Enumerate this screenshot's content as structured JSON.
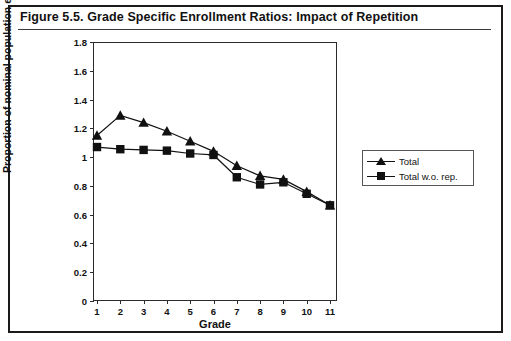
{
  "figure": {
    "title": "Figure 5.5.  Grade Specific Enrollment Ratios: Impact of Repetition"
  },
  "chart_data": {
    "type": "line",
    "title": "Grade Specific Enrollment Ratios: Impact of Repetition",
    "xlabel": "Grade",
    "ylabel": "Proportion of nominal population enrolled",
    "categories": [
      1,
      2,
      3,
      4,
      5,
      6,
      7,
      8,
      9,
      10,
      11
    ],
    "x_tick_labels": [
      "1",
      "2",
      "3",
      "4",
      "5",
      "6",
      "7",
      "8",
      "9",
      "10",
      "11"
    ],
    "y_tick_labels": [
      "0",
      "0.2",
      "0.4",
      "0.6",
      "0.8",
      "1",
      "1.2",
      "1.4",
      "1.6",
      "1.8"
    ],
    "y_tick_values": [
      0,
      0.2,
      0.4,
      0.6,
      0.8,
      1.0,
      1.2,
      1.4,
      1.6,
      1.8
    ],
    "ylim": [
      0,
      1.8
    ],
    "xlim": [
      1,
      11
    ],
    "grid": false,
    "legend_position": "right",
    "series": [
      {
        "name": "Total",
        "marker": "triangle",
        "color": "#111111",
        "values": [
          1.15,
          1.29,
          1.24,
          1.18,
          1.11,
          1.04,
          0.94,
          0.87,
          0.845,
          0.76,
          0.665
        ]
      },
      {
        "name": "Total w.o. rep.",
        "marker": "square",
        "color": "#111111",
        "values": [
          1.07,
          1.055,
          1.05,
          1.045,
          1.025,
          1.015,
          0.86,
          0.81,
          0.825,
          0.745,
          0.665
        ]
      }
    ]
  },
  "legend": {
    "entries": [
      {
        "label": "Total",
        "marker": "triangle"
      },
      {
        "label": "Total w.o. rep.",
        "marker": "square"
      }
    ]
  }
}
